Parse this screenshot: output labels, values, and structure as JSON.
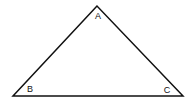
{
  "diagram": {
    "type": "triangle",
    "stroke_color": "#111111",
    "vertices": {
      "A": {
        "label": "A",
        "x": 97,
        "y": 6
      },
      "B": {
        "label": "B",
        "x": 13,
        "y": 96
      },
      "C": {
        "label": "C",
        "x": 183,
        "y": 96
      }
    }
  }
}
